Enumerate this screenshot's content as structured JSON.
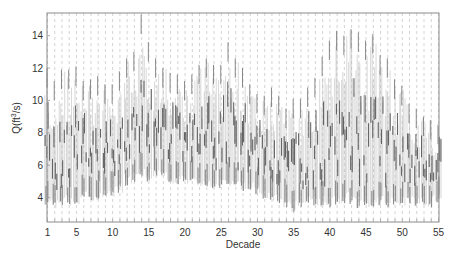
{
  "chart_data": {
    "type": "scatter",
    "title": "",
    "xlabel": "Decade",
    "ylabel": "Q(ft³/s)",
    "ylabel_parts": {
      "base": "Q(ft",
      "sup": "3",
      "rest": "/s)"
    },
    "xlim": [
      1,
      55
    ],
    "ylim": [
      2.5,
      15.4
    ],
    "x_ticks": [
      1,
      5,
      10,
      15,
      20,
      25,
      30,
      35,
      40,
      45,
      50,
      55
    ],
    "y_ticks": [
      4,
      6,
      8,
      10,
      12,
      14
    ],
    "grid": "vertical dashed lines between each decade",
    "legend": null,
    "series": [
      {
        "name": "per-decade distribution (dense vertical strokes)",
        "decades": [
          1,
          2,
          3,
          4,
          5,
          6,
          7,
          8,
          9,
          10,
          11,
          12,
          13,
          14,
          15,
          16,
          17,
          18,
          19,
          20,
          21,
          22,
          23,
          24,
          25,
          26,
          27,
          28,
          29,
          30,
          31,
          32,
          33,
          34,
          35,
          36,
          37,
          38,
          39,
          40,
          41,
          42,
          43,
          44,
          45,
          46,
          47,
          48,
          49,
          50,
          51,
          52,
          53,
          54,
          55
        ],
        "max": [
          12.0,
          11.2,
          11.9,
          11.9,
          12.1,
          11.2,
          11.3,
          11.5,
          11.0,
          11.0,
          11.8,
          12.6,
          13.0,
          15.3,
          13.6,
          12.6,
          12.0,
          11.7,
          11.6,
          11.2,
          11.6,
          12.2,
          12.6,
          12.2,
          12.2,
          13.6,
          12.6,
          12.0,
          11.0,
          10.4,
          10.3,
          10.8,
          10.3,
          9.5,
          10.1,
          10.1,
          10.8,
          11.4,
          12.7,
          13.7,
          14.3,
          14.0,
          14.4,
          14.2,
          13.7,
          14.1,
          12.8,
          12.6,
          11.3,
          10.9,
          9.8,
          9.5,
          9.0,
          8.8,
          8.5
        ],
        "min": [
          3.5,
          3.3,
          3.4,
          3.5,
          3.6,
          3.8,
          3.7,
          3.8,
          3.9,
          4.0,
          4.3,
          4.7,
          4.8,
          5.3,
          5.0,
          5.3,
          5.2,
          4.8,
          4.8,
          4.8,
          5.0,
          4.6,
          4.7,
          4.5,
          4.6,
          4.7,
          4.6,
          4.4,
          4.5,
          4.2,
          3.9,
          3.8,
          3.6,
          3.4,
          3.1,
          3.3,
          3.5,
          3.4,
          3.4,
          3.3,
          3.5,
          3.6,
          3.6,
          3.3,
          3.4,
          3.4,
          3.5,
          3.2,
          3.4,
          3.3,
          3.6,
          3.3,
          3.5,
          3.4,
          3.6
        ],
        "dense_low": [
          4.5,
          4.3,
          4.5,
          4.6,
          4.7,
          4.8,
          4.9,
          4.9,
          5.0,
          5.2,
          5.8,
          6.1,
          6.2,
          6.4,
          6.3,
          6.2,
          6.0,
          5.9,
          5.8,
          5.8,
          6.0,
          5.7,
          5.6,
          5.6,
          5.5,
          5.6,
          5.4,
          5.4,
          5.3,
          5.1,
          4.9,
          4.8,
          4.6,
          4.4,
          4.3,
          4.4,
          4.6,
          4.5,
          4.6,
          4.6,
          4.7,
          4.8,
          4.9,
          4.6,
          4.7,
          4.7,
          4.8,
          4.5,
          4.6,
          4.6,
          4.9,
          4.6,
          4.8,
          4.7,
          4.9
        ],
        "dense_high": [
          8.5,
          8.0,
          8.4,
          8.4,
          8.6,
          8.0,
          8.1,
          8.2,
          8.0,
          8.0,
          8.6,
          9.1,
          9.4,
          10.8,
          9.9,
          9.3,
          8.9,
          8.7,
          8.6,
          8.4,
          8.7,
          9.0,
          9.2,
          9.0,
          9.0,
          9.8,
          9.2,
          8.8,
          8.2,
          7.8,
          7.6,
          7.9,
          7.6,
          7.1,
          7.4,
          7.5,
          7.9,
          8.3,
          9.1,
          9.8,
          10.2,
          10.0,
          10.3,
          10.2,
          9.8,
          10.1,
          9.3,
          9.1,
          8.3,
          8.0,
          7.4,
          7.2,
          6.9,
          6.8,
          6.6
        ]
      }
    ],
    "colors": {
      "strokes": "#7a7a7a",
      "dark_strokes": "#3a3a3a",
      "grid": "#c8c8c8",
      "axes": "#888888",
      "text": "#333333"
    }
  }
}
